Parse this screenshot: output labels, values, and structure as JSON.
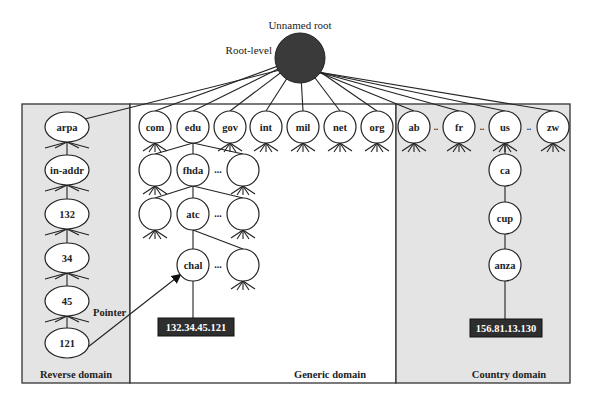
{
  "root": {
    "title": "Unnamed root",
    "level_label": "Root-level",
    "color": "#3a3a3a"
  },
  "regions": {
    "reverse": {
      "label": "Reverse domain",
      "background": "#e4e4e4"
    },
    "generic": {
      "label": "Generic domain",
      "background": "#ffffff"
    },
    "country": {
      "label": "Country domain",
      "background": "#e4e4e4"
    }
  },
  "reverse_domain": {
    "nodes": [
      "arpa",
      "in-addr",
      "132",
      "34",
      "45",
      "121"
    ],
    "pointer_label": "Pointer"
  },
  "generic_domain": {
    "top_level": [
      "com",
      "edu",
      "gov",
      "int",
      "mil",
      "net",
      "org"
    ],
    "edu_children": [
      "",
      "fhda",
      ""
    ],
    "fhda_children": [
      "",
      "atc",
      ""
    ],
    "atc_children": [
      "chal",
      ""
    ],
    "ellipsis": "...",
    "host_address": "132.34.45.121"
  },
  "country_domain": {
    "top_level": [
      "ab",
      "fr",
      "us",
      "zw"
    ],
    "separator": "..",
    "path": [
      "ca",
      "cup",
      "anza"
    ],
    "host_address": "156.81.13.130"
  }
}
